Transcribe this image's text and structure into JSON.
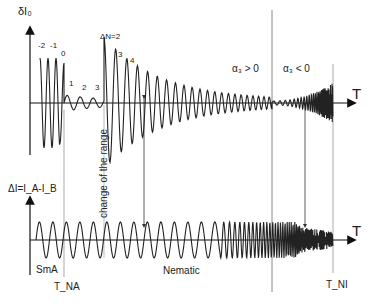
{
  "diagram": {
    "top_panel": {
      "y_label": "δI₀",
      "x_label": "T",
      "order_labels_left": [
        "-2",
        "-1",
        "0",
        "1",
        "2",
        "3"
      ],
      "order_labels_right": [
        "ΔN=2",
        "3",
        "4"
      ],
      "region_labels": [
        "α₃ > 0",
        "α₃ < 0"
      ]
    },
    "bottom_panel": {
      "y_label": "ΔI=I_A-I_B",
      "x_label": "T",
      "phase_labels": [
        "SmA",
        "Nematic"
      ],
      "transition_labels": [
        "T_NA",
        "T_NI"
      ]
    },
    "annotations": {
      "range_change": "change of the range"
    },
    "colors": {
      "line": "#222222",
      "guide": "#999999"
    }
  }
}
